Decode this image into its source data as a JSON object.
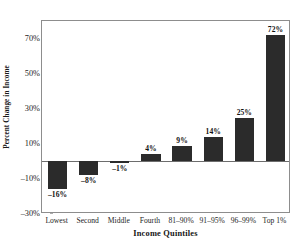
{
  "chart_data": {
    "type": "bar",
    "title": "",
    "xlabel": "Income Quintiles",
    "ylabel": "Percent Change in Income",
    "categories": [
      "Lowest",
      "Second",
      "Middle",
      "Fourth",
      "81–90%",
      "91–95%",
      "96–99%",
      "Top 1%"
    ],
    "values": [
      -16,
      -8,
      -1,
      4,
      9,
      14,
      25,
      72
    ],
    "data_labels": [
      "–16%",
      "–8%",
      "–1%",
      "4%",
      "9%",
      "14%",
      "25%",
      "72%"
    ],
    "ylim": [
      -30,
      80
    ],
    "ytick_values": [
      70,
      50,
      30,
      10,
      -10,
      -30
    ],
    "ytick_labels": [
      "70%",
      "50%",
      "30%",
      "10%",
      "–10%",
      "–30%"
    ],
    "grid": false,
    "legend": false,
    "bar_color": "#2b2b2b",
    "frame_color": "#8d8d8d",
    "background_color": "#ffffff"
  }
}
